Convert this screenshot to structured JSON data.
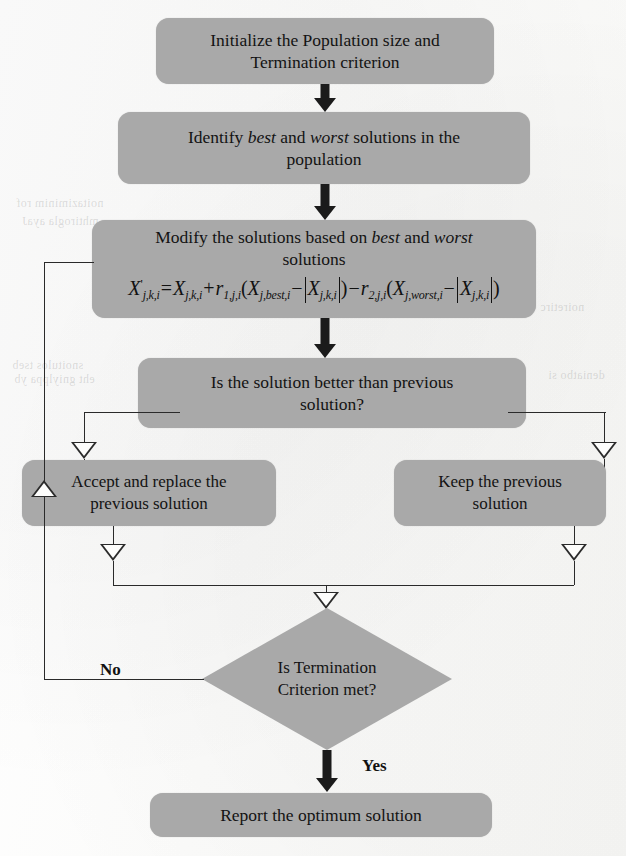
{
  "document": {
    "title": "Jaya algorithm flowchart",
    "kind": "flowchart"
  },
  "colors": {
    "node_fill": "#a9a9a9",
    "node_text": "#131313",
    "arrow_solid": "#1b1b1b",
    "connector_line": "#2a2a2a",
    "page_background": "#fdfdfc"
  },
  "nodes": {
    "initialize": {
      "id": "initialize",
      "shape": "rounded-rect",
      "line1": "Initialize the Population size and",
      "line2": "Termination criterion"
    },
    "identify": {
      "id": "identify",
      "shape": "rounded-rect",
      "pre": "Identify ",
      "em1": "best",
      "mid": " and ",
      "em2": "worst",
      "post": " solutions in the",
      "line2": "population"
    },
    "modify": {
      "id": "modify",
      "shape": "rounded-rect",
      "pre": "Modify the solutions based on ",
      "em1": "best",
      "mid": " and ",
      "em2": "worst",
      "line2": "solutions",
      "formula_plain": "X'_{j,k,i} = X_{j,k,i} + r_{1,j,i}(X_{j,best,i} - |X_{j,k,i}|) - r_{2,j,i}(X_{j,worst,i} - |X_{j,k,i}|)"
    },
    "compare": {
      "id": "compare",
      "shape": "rounded-rect",
      "line1": "Is the solution better than previous",
      "line2": "solution?"
    },
    "accept": {
      "id": "accept",
      "shape": "rounded-rect",
      "line1": "Accept and replace the",
      "line2": "previous solution"
    },
    "keep": {
      "id": "keep",
      "shape": "rounded-rect",
      "line1": "Keep the previous",
      "line2": "solution"
    },
    "termination": {
      "id": "termination",
      "shape": "diamond",
      "line1": "Is Termination",
      "line2": "Criterion met?"
    },
    "report": {
      "id": "report",
      "shape": "rounded-rect",
      "line1": "Report the optimum solution"
    }
  },
  "branch_labels": {
    "no": "No",
    "yes": "Yes"
  },
  "formula_tokens": {
    "x_prime": "X",
    "prime": "'",
    "sub_jki": "j,k,i",
    "eq": "=",
    "plus": "+",
    "minus": "−",
    "r": "r",
    "sub_r1": "1,j,i",
    "sub_r2": "2,j,i",
    "sub_best": "j,best,i",
    "sub_worst": "j,worst,i",
    "open": "(",
    "close": ")"
  },
  "ghost_text": {
    "items": [
      "noitaziminim rof",
      "mhtirogla ayaJ",
      "snoitulos tseb",
      "eht gniylppa yb",
      "noiretirc",
      "deniatbo si"
    ]
  }
}
